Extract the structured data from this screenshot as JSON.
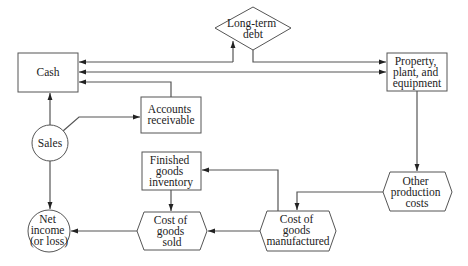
{
  "nodes": {
    "cash": {
      "lines": [
        "Cash"
      ]
    },
    "long_term_debt": {
      "lines": [
        "Long-term",
        "debt"
      ]
    },
    "ppe": {
      "lines": [
        "Property,",
        "plant, and",
        "equipment"
      ]
    },
    "accounts_receivable": {
      "lines": [
        "Accounts",
        "receivable"
      ]
    },
    "sales": {
      "lines": [
        "Sales"
      ]
    },
    "finished_goods": {
      "lines": [
        "Finished",
        "goods",
        "inventory"
      ]
    },
    "other_production_costs": {
      "lines": [
        "Other",
        "production",
        "costs"
      ]
    },
    "cogs": {
      "lines": [
        "Cost of",
        "goods",
        "sold"
      ]
    },
    "cogm": {
      "lines": [
        "Cost of",
        "goods",
        "manufactured"
      ]
    },
    "net_income": {
      "lines": [
        "Net",
        "income",
        "(or loss)"
      ]
    }
  },
  "colors": {
    "line": "#555555",
    "text": "#222222",
    "background": "#ffffff"
  }
}
